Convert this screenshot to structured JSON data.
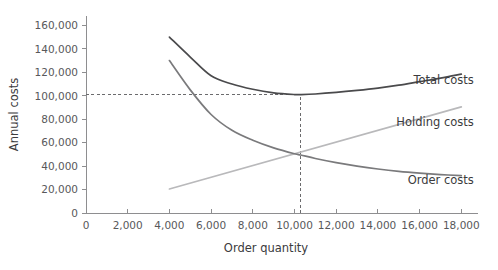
{
  "chart_data": {
    "type": "line",
    "title": "",
    "xlabel": "Order quantity",
    "ylabel": "Annual costs",
    "xlim": [
      0,
      18800
    ],
    "ylim": [
      0,
      168000
    ],
    "grid": false,
    "legend_position": "inline-right",
    "x_ticks": [
      0,
      2000,
      4000,
      6000,
      8000,
      10000,
      12000,
      14000,
      16000,
      18000
    ],
    "x_tick_labels": [
      "0",
      "2,000",
      "4,000",
      "6,000",
      "8,000",
      "10,000",
      "12,000",
      "14,000",
      "16,000",
      "18,000"
    ],
    "y_ticks": [
      0,
      20000,
      40000,
      60000,
      80000,
      100000,
      120000,
      140000,
      160000
    ],
    "y_tick_labels": [
      "0",
      "20,000",
      "40,000",
      "60,000",
      "80,000",
      "100,000",
      "120,000",
      "140,000",
      "160,000"
    ],
    "series": [
      {
        "name": "Total costs",
        "color": "#4a4a4c",
        "width": 1.7,
        "label_x": 18600,
        "label_y": 110000,
        "x": [
          4000,
          5000,
          6000,
          7000,
          8000,
          9000,
          10000,
          10300,
          11000,
          12000,
          13000,
          14000,
          15000,
          16000,
          17000,
          18000
        ],
        "y": [
          150000,
          133000,
          117000,
          110000,
          105500,
          102500,
          101000,
          101000,
          101500,
          102800,
          104500,
          106500,
          109000,
          112000,
          115000,
          118500
        ]
      },
      {
        "name": "Holding costs",
        "color": "#b9b9bb",
        "width": 1.7,
        "label_x": 18600,
        "label_y": 74000,
        "x": [
          4000,
          18000
        ],
        "y": [
          20500,
          90500
        ]
      },
      {
        "name": "Order costs",
        "color": "#7a7a7c",
        "width": 1.7,
        "label_x": 18600,
        "label_y": 25000,
        "x": [
          4000,
          5000,
          6000,
          7000,
          8000,
          9000,
          10000,
          10300,
          11000,
          12000,
          13000,
          14000,
          15000,
          16000,
          17000,
          18000
        ],
        "y": [
          130000,
          105000,
          84000,
          70500,
          62000,
          55500,
          50500,
          49500,
          46500,
          43000,
          40000,
          37500,
          35500,
          34000,
          32800,
          31800
        ]
      }
    ],
    "annotations": [
      {
        "name": "optimal-cost-guide-horizontal",
        "type": "dashed-horizontal",
        "y": 101000,
        "x_from": 0,
        "x_to": 10300
      },
      {
        "name": "optimal-quantity-guide-vertical",
        "type": "dashed-vertical",
        "x": 10300,
        "y_from": 0,
        "y_to": 101000
      }
    ]
  },
  "axes": {
    "x_title": "Order quantity",
    "y_title": "Annual costs"
  },
  "labels": {
    "total_costs": "Total costs",
    "holding_costs": "Holding costs",
    "order_costs": "Order costs"
  }
}
